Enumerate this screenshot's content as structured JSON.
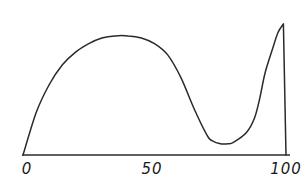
{
  "chart_data": {
    "type": "line",
    "title": "",
    "xlabel": "",
    "ylabel": "",
    "xlim": [
      0,
      100
    ],
    "grid": false,
    "legend": null,
    "x_ticks": [
      0,
      50,
      100
    ],
    "x_tick_labels": [
      "0",
      "50",
      "100"
    ],
    "series": [
      {
        "name": "curve",
        "x": [
          0,
          5,
          10,
          15,
          20,
          25,
          30,
          35,
          40,
          45,
          50,
          55,
          60,
          65,
          70,
          72,
          75,
          78,
          80,
          85,
          88,
          90,
          92,
          95,
          97,
          99,
          100
        ],
        "y": [
          0,
          30,
          50,
          64,
          73,
          79,
          83,
          84.5,
          84.5,
          83,
          79,
          71,
          55,
          33,
          14,
          10,
          8,
          8,
          9,
          16,
          26,
          40,
          58,
          76,
          87,
          93,
          0
        ]
      }
    ]
  },
  "axis": {
    "stroke_color": "#2a2a2a"
  }
}
